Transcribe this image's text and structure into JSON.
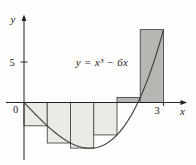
{
  "figure": {
    "equation_label": "y = x³ − 6x",
    "x_axis_label": "x",
    "y_axis_label": "y",
    "origin_label": "0",
    "x_tick_label": "3",
    "y_tick_label": "5"
  },
  "chart_data": {
    "type": "line",
    "title": "y = x³ − 6x",
    "function": "f(x) = x^3 - 6x",
    "coefficients": [
      0,
      -6,
      0,
      1
    ],
    "x_range": [
      0,
      3
    ],
    "x_axis_ticks": [
      3
    ],
    "y_axis_ticks": [
      5
    ],
    "x_intercepts_shown": [
      0,
      2.449
    ],
    "axis_x_span": [
      -0.4,
      3.5
    ],
    "axis_y_span": [
      -7.2,
      10.7
    ],
    "grid": false,
    "legend": "none",
    "curve_points": [
      [
        0,
        0
      ],
      [
        0.25,
        -1.484
      ],
      [
        0.5,
        -2.875
      ],
      [
        0.75,
        -4.078
      ],
      [
        1,
        -5
      ],
      [
        1.25,
        -5.547
      ],
      [
        1.5,
        -5.625
      ],
      [
        1.75,
        -5.141
      ],
      [
        2,
        -4
      ],
      [
        2.25,
        -2.109
      ],
      [
        2.5,
        0.625
      ],
      [
        2.75,
        4.297
      ],
      [
        3,
        9
      ]
    ],
    "riemann_rectangles": [
      {
        "x0": 0.0,
        "x1": 0.5,
        "height": -2.875
      },
      {
        "x0": 0.5,
        "x1": 1.0,
        "height": -5.0
      },
      {
        "x0": 1.0,
        "x1": 1.5,
        "height": -5.625
      },
      {
        "x0": 1.5,
        "x1": 2.0,
        "height": -4.0
      },
      {
        "x0": 2.0,
        "x1": 2.5,
        "height": 0.625
      },
      {
        "x0": 2.5,
        "x1": 3.0,
        "height": 9.0
      }
    ],
    "colors": {
      "negative_rect_fill": "#ebeae4",
      "positive_rect_fill": "#b7b6b2",
      "rect_border": "#4a4a48",
      "curve": "#3c3c3a",
      "axis": "#222222",
      "background": "#fdfdfc"
    }
  }
}
